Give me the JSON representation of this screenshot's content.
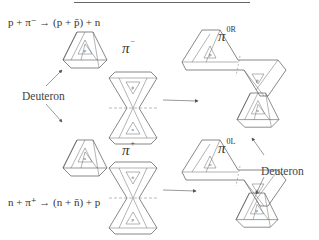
{
  "reactions": {
    "top": {
      "text": "p + π⁻ → (p + p̄) + n"
    },
    "bottom": {
      "text": "n + π⁺ → (n + n̄) + p"
    }
  },
  "labels": {
    "deuteron_left": "Deuteron",
    "deuteron_right": "Deuteron"
  },
  "pions": {
    "pi_minus": {
      "symbol": "π",
      "sup": "−"
    },
    "pi_plus": {
      "symbol": "π",
      "sup": "+"
    },
    "pi_0R": {
      "symbol": "π",
      "sup": "0R"
    },
    "pi_0L": {
      "symbol": "π",
      "sup": "0L"
    }
  },
  "triangle_labels": {
    "deuteron_top_p": "p",
    "deuteron_bottom_n": "n",
    "pi_minus_top": "p̄",
    "pi_minus_bottom": "n",
    "pi_plus_top": "n̄",
    "pi_plus_bottom": "p",
    "pi0R_left": "p",
    "pi0R_right": "p̄",
    "pi0L_left": "n",
    "pi0L_right": "n̄",
    "product_n": "n",
    "product_p": "p"
  }
}
